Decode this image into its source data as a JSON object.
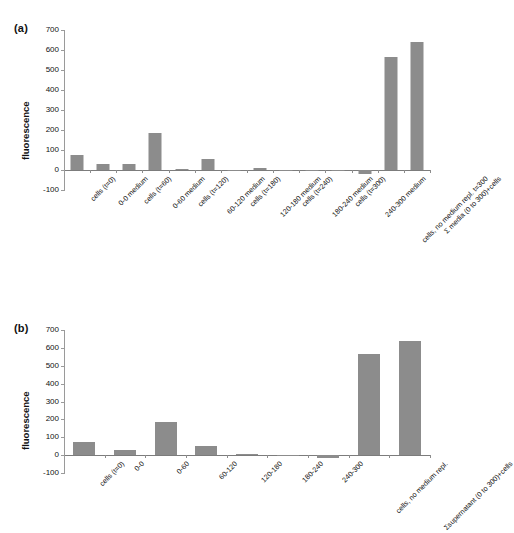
{
  "figure": {
    "panels": [
      {
        "letter": "(a)",
        "ylabel": "fluorescence",
        "yticks": [
          "700",
          "600",
          "500",
          "400",
          "300",
          "200",
          "100",
          "0",
          "-100"
        ]
      },
      {
        "letter": "(b)",
        "ylabel": "fluorescence",
        "yticks": [
          "700",
          "600",
          "500",
          "400",
          "300",
          "200",
          "100",
          "0",
          "-100"
        ]
      }
    ]
  },
  "chart_data": [
    {
      "type": "bar",
      "panel": "(a)",
      "title": "",
      "xlabel": "",
      "ylabel": "fluorescence",
      "ylim": [
        -100,
        700
      ],
      "yticks": [
        -100,
        0,
        100,
        200,
        300,
        400,
        500,
        600,
        700
      ],
      "grid": false,
      "legend": "none",
      "bar_color": "#8c8c8c",
      "categories": [
        "cells (t=0)",
        "0-0 medium",
        "cells (t=60)",
        "0-60  medium",
        "cells (t=120)",
        "60-120  medium",
        "cells (t=180)",
        "120-180  medium",
        "cells (t=240)",
        "180-240  medium",
        "cells (t=300)",
        "240-300  medium",
        "cells, no medium repl. t=300",
        "Σ media (0 to 300)+cells"
      ],
      "values": [
        76,
        28,
        31,
        184,
        5,
        53,
        2,
        8,
        -3,
        1,
        -2,
        -18,
        564,
        640
      ]
    },
    {
      "type": "bar",
      "panel": "(b)",
      "title": "",
      "xlabel": "",
      "ylabel": "fluorescence",
      "ylim": [
        -100,
        700
      ],
      "yticks": [
        -100,
        0,
        100,
        200,
        300,
        400,
        500,
        600,
        700
      ],
      "grid": false,
      "legend": "none",
      "bar_color": "#8c8c8c",
      "categories": [
        "cells (t=0)",
        "0-0",
        "0-60",
        "60-120",
        "120-180",
        "180-240",
        "240-300",
        "cells, no medium repl.",
        "Σsupernatant (0 to 300)+cells"
      ],
      "values": [
        76,
        28,
        184,
        53,
        8,
        2,
        -14,
        564,
        640
      ]
    }
  ]
}
